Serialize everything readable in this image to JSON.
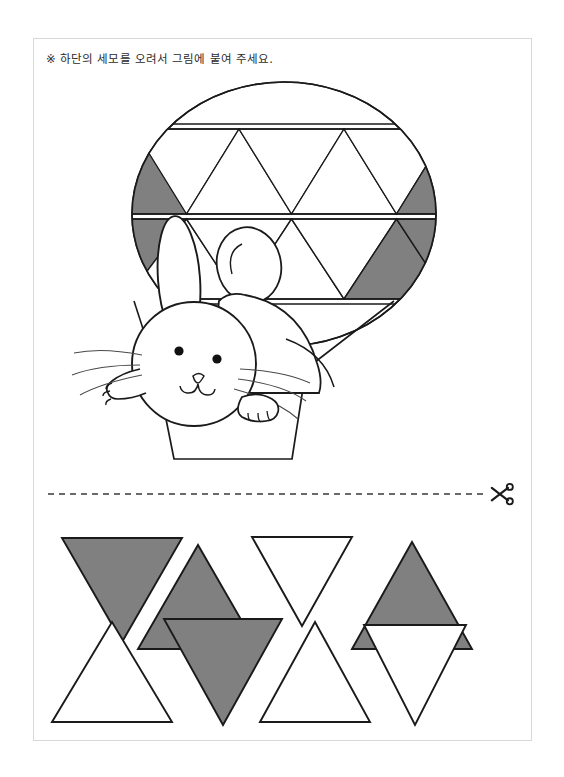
{
  "page": {
    "background_color": "#ffffff",
    "border_color": "#d8d8d8",
    "width": 564,
    "height": 777
  },
  "instruction": {
    "marker": "※",
    "text": "※ 하단의 세모를 오려서 그림에 붙여 주세요.",
    "body_only": "하단의 세모를 오려서 그림에 붙여 주세요."
  },
  "colors": {
    "gray_fill": "#808080",
    "outline": "#1a1a1a",
    "white_fill": "#ffffff",
    "cut_line": "#3a3a3a",
    "page_border": "#d8d8d8"
  },
  "illustration": {
    "name": "hot-air-balloon-with-rabbit",
    "balloon": {
      "shape": "ellipse",
      "center_x": 250,
      "center_y": 175,
      "radius_x": 152,
      "radius_y": 132,
      "bands": [
        {
          "name": "top-band",
          "y_top": 84,
          "y_bottom": 175,
          "triangles": [
            {
              "index": 0,
              "direction": "up",
              "fill": "gray",
              "clipped": true
            },
            {
              "index": 1,
              "direction": "down",
              "fill": "white",
              "clipped": false
            },
            {
              "index": 2,
              "direction": "up",
              "fill": "white",
              "clipped": false
            },
            {
              "index": 3,
              "direction": "down",
              "fill": "white",
              "clipped": false
            },
            {
              "index": 4,
              "direction": "up",
              "fill": "white",
              "clipped": false
            },
            {
              "index": 5,
              "direction": "down",
              "fill": "white",
              "clipped": false
            },
            {
              "index": 6,
              "direction": "up",
              "fill": "gray",
              "clipped": true
            }
          ]
        },
        {
          "name": "middle-band",
          "y_top": 177,
          "y_bottom": 260,
          "triangles": [
            {
              "index": 0,
              "direction": "down",
              "fill": "gray",
              "clipped": true
            },
            {
              "index": 1,
              "direction": "up",
              "fill": "white",
              "clipped": false
            },
            {
              "index": 2,
              "direction": "down",
              "fill": "white",
              "clipped": false
            },
            {
              "index": 3,
              "direction": "up",
              "fill": "white",
              "clipped": false
            },
            {
              "index": 4,
              "direction": "down",
              "fill": "white",
              "clipped": false
            },
            {
              "index": 5,
              "direction": "up",
              "fill": "gray",
              "clipped": false
            },
            {
              "index": 6,
              "direction": "down",
              "fill": "gray",
              "clipped": true
            }
          ]
        },
        {
          "name": "bottom-band",
          "y_top": 262,
          "y_bottom": 307,
          "triangles": []
        }
      ],
      "stripe_lines": [
        84,
        90,
        175,
        180,
        260,
        265
      ]
    },
    "rabbit": {
      "name": "rabbit",
      "features": [
        "long-left-ear",
        "round-right-ear",
        "two-eyes",
        "nose",
        "mouth",
        "whiskers",
        "left-paw",
        "right-paw",
        "body"
      ],
      "eye_count": 2,
      "whisker_count": 6
    },
    "basket": {
      "name": "balloon-basket",
      "shape": "trapezoid"
    }
  },
  "cut_line": {
    "name": "cut-line",
    "style": "dashed",
    "y": 455,
    "scissors_icon": "scissors-icon",
    "scissors_glyph": "✂"
  },
  "cutouts": {
    "label": "cut-out-triangles",
    "rows": [
      {
        "row_index": 0,
        "triangles": [
          {
            "id": "t1",
            "direction": "down",
            "fill": "gray",
            "size": 104
          },
          {
            "id": "t2",
            "direction": "up",
            "fill": "gray",
            "size": 104
          },
          {
            "id": "t3",
            "direction": "down",
            "fill": "white",
            "size": 98
          },
          {
            "id": "t4",
            "direction": "up",
            "fill": "gray",
            "size": 104
          }
        ]
      },
      {
        "row_index": 1,
        "triangles": [
          {
            "id": "t5",
            "direction": "up",
            "fill": "white",
            "size": 104
          },
          {
            "id": "t6",
            "direction": "down",
            "fill": "gray",
            "size": 110
          },
          {
            "id": "t7",
            "direction": "up",
            "fill": "white",
            "size": 104
          },
          {
            "id": "t8",
            "direction": "down",
            "fill": "white",
            "size": 104
          }
        ]
      }
    ]
  }
}
